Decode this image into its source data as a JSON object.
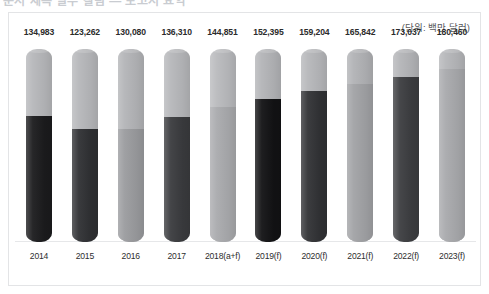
{
  "top_heading": "문서 제목 일부 잘림 — 보고서 요약",
  "unit_note": "(단위: 백만 달러)",
  "chart_data": {
    "type": "bar",
    "title": "",
    "subtitle": "",
    "xlabel": "",
    "ylabel": "",
    "unit": "백만 달러",
    "grid": false,
    "legend_position": "none",
    "ylim": [
      0,
      200000
    ],
    "categories": [
      "2014",
      "2015",
      "2016",
      "2017",
      "2018(a+f)",
      "2019(f)",
      "2020(f)",
      "2021(f)",
      "2022(f)",
      "2023(f)"
    ],
    "values": [
      134983,
      123262,
      130080,
      136310,
      144851,
      152395,
      159204,
      165842,
      173037,
      180460
    ],
    "value_labels": [
      "134,983",
      "123,262",
      "130,080",
      "136,310",
      "144,851",
      "152,395",
      "159,204",
      "165,842",
      "173,037",
      "180,460"
    ],
    "bar_colors": [
      "#1b1b1d",
      "#2f3033",
      "#9a9b9e",
      "#3a3b3e",
      "#a9aaad",
      "#121214",
      "#313235",
      "#a1a2a5",
      "#3c3d40",
      "#a8a9ac"
    ],
    "bar_track_colors": [
      "#b6b7ba",
      "#b6b7ba",
      "#b3b4b7",
      "#b6b7ba",
      "#b9babd",
      "#b3b4b7",
      "#b6b7ba",
      "#b1b2b5",
      "#b4b5b8",
      "#b5b6b9"
    ],
    "fill_ratios": [
      0.655,
      0.587,
      0.585,
      0.648,
      0.7,
      0.742,
      0.785,
      0.818,
      0.855,
      0.895
    ]
  }
}
